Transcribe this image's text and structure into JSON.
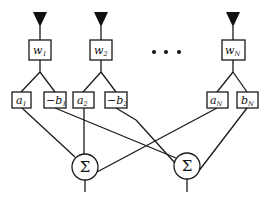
{
  "diagram": {
    "type": "beamforming-network",
    "colors": {
      "line": "#1a1a1a",
      "background": "#ffffff"
    },
    "antennas": [
      {
        "id": "ant1",
        "icon": "antenna-triangle-icon"
      },
      {
        "id": "ant2",
        "icon": "antenna-triangle-icon"
      },
      {
        "id": "antN",
        "icon": "antenna-triangle-icon"
      }
    ],
    "weights": [
      {
        "base": "w",
        "sub": "1"
      },
      {
        "base": "w",
        "sub": "2"
      },
      {
        "base": "w",
        "sub": "N"
      }
    ],
    "coefficients": [
      {
        "base": "a",
        "sub": "1"
      },
      {
        "base": "−b",
        "sub": "1"
      },
      {
        "base": "a",
        "sub": "2"
      },
      {
        "base": "−b",
        "sub": "2"
      },
      {
        "base": "a",
        "sub": "N"
      },
      {
        "base": "b",
        "sub": "N"
      }
    ],
    "ellipsis": "• • •",
    "summers": [
      {
        "symbol": "Σ"
      },
      {
        "symbol": "Σ"
      }
    ]
  }
}
